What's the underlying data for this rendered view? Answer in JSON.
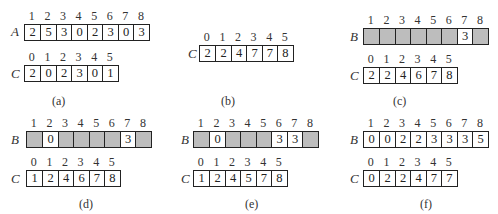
{
  "panels": [
    {
      "id": "a",
      "caption": "(a)",
      "arrays": [
        {
          "name": "A",
          "indices": [
            "1",
            "2",
            "3",
            "4",
            "5",
            "6",
            "7",
            "8"
          ],
          "cells": [
            "2",
            "5",
            "3",
            "0",
            "2",
            "3",
            "0",
            "3"
          ],
          "shaded": [
            false,
            false,
            false,
            false,
            false,
            false,
            false,
            false
          ]
        },
        {
          "name": "C",
          "indices": [
            "0",
            "1",
            "2",
            "3",
            "4",
            "5"
          ],
          "cells": [
            "2",
            "0",
            "2",
            "3",
            "0",
            "1"
          ],
          "shaded": [
            false,
            false,
            false,
            false,
            false,
            false
          ]
        }
      ]
    },
    {
      "id": "b",
      "caption": "(b)",
      "arrays": [
        {
          "name": "C",
          "indices": [
            "0",
            "1",
            "2",
            "3",
            "4",
            "5"
          ],
          "cells": [
            "2",
            "2",
            "4",
            "7",
            "7",
            "8"
          ],
          "shaded": [
            false,
            false,
            false,
            false,
            false,
            false
          ]
        }
      ]
    },
    {
      "id": "c",
      "caption": "(c)",
      "arrays": [
        {
          "name": "B",
          "indices": [
            "1",
            "2",
            "3",
            "4",
            "5",
            "6",
            "7",
            "8"
          ],
          "cells": [
            "",
            "",
            "",
            "",
            "",
            "",
            "3",
            ""
          ],
          "shaded": [
            true,
            true,
            true,
            true,
            true,
            true,
            false,
            true
          ]
        },
        {
          "name": "C",
          "indices": [
            "0",
            "1",
            "2",
            "3",
            "4",
            "5"
          ],
          "cells": [
            "2",
            "2",
            "4",
            "6",
            "7",
            "8"
          ],
          "shaded": [
            false,
            false,
            false,
            false,
            false,
            false
          ]
        }
      ]
    },
    {
      "id": "d",
      "caption": "(d)",
      "arrays": [
        {
          "name": "B",
          "indices": [
            "1",
            "2",
            "3",
            "4",
            "5",
            "6",
            "7",
            "8"
          ],
          "cells": [
            "",
            "0",
            "",
            "",
            "",
            "",
            "3",
            ""
          ],
          "shaded": [
            true,
            false,
            true,
            true,
            true,
            true,
            false,
            true
          ]
        },
        {
          "name": "C",
          "indices": [
            "0",
            "1",
            "2",
            "3",
            "4",
            "5"
          ],
          "cells": [
            "1",
            "2",
            "4",
            "6",
            "7",
            "8"
          ],
          "shaded": [
            false,
            false,
            false,
            false,
            false,
            false
          ]
        }
      ]
    },
    {
      "id": "e",
      "caption": "(e)",
      "arrays": [
        {
          "name": "B",
          "indices": [
            "1",
            "2",
            "3",
            "4",
            "5",
            "6",
            "7",
            "8"
          ],
          "cells": [
            "",
            "0",
            "",
            "",
            "",
            "3",
            "3",
            ""
          ],
          "shaded": [
            true,
            false,
            true,
            true,
            true,
            false,
            false,
            true
          ]
        },
        {
          "name": "C",
          "indices": [
            "0",
            "1",
            "2",
            "3",
            "4",
            "5"
          ],
          "cells": [
            "1",
            "2",
            "4",
            "5",
            "7",
            "8"
          ],
          "shaded": [
            false,
            false,
            false,
            false,
            false,
            false
          ]
        }
      ]
    },
    {
      "id": "f",
      "caption": "(f)",
      "arrays": [
        {
          "name": "B",
          "indices": [
            "1",
            "2",
            "3",
            "4",
            "5",
            "6",
            "7",
            "8"
          ],
          "cells": [
            "0",
            "0",
            "2",
            "2",
            "3",
            "3",
            "3",
            "5"
          ],
          "shaded": [
            false,
            false,
            false,
            false,
            false,
            false,
            false,
            false
          ]
        },
        {
          "name": "C",
          "indices": [
            "0",
            "1",
            "2",
            "3",
            "4",
            "5"
          ],
          "cells": [
            "0",
            "2",
            "2",
            "4",
            "7",
            "7"
          ],
          "shaded": [
            false,
            false,
            false,
            false,
            false,
            false
          ]
        }
      ]
    }
  ],
  "colors": {
    "shaded_cell": "#bdbdbd",
    "border": "#222222"
  }
}
